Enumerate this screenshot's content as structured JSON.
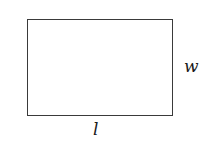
{
  "diagram": {
    "shape": "rectangle",
    "labels": {
      "width": "w",
      "length": "l"
    },
    "colors": {
      "stroke": "#3a3a3a",
      "fill": "#ffffff",
      "text": "#1a1a1a"
    }
  }
}
